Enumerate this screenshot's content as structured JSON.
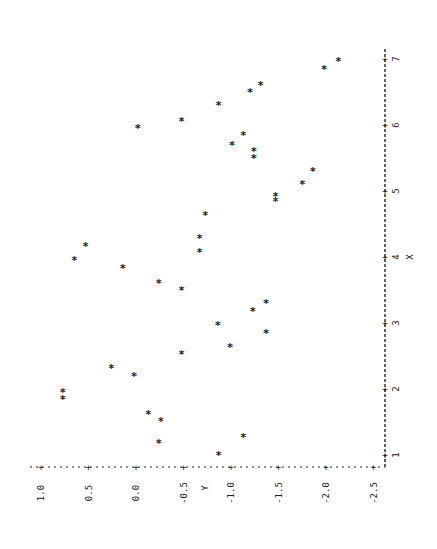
{
  "chart_data": {
    "type": "scatter",
    "title": "",
    "rotation": "rotated 90 degrees counter-clockwise (Y axis along bottom, X axis along right)",
    "xlabel": "X",
    "ylabel": "Y",
    "xlim": [
      1,
      7
    ],
    "ylim": [
      -2.5,
      1.0
    ],
    "x_ticks": [
      "1",
      "2",
      "3",
      "4",
      "5",
      "6",
      "7"
    ],
    "y_ticks": [
      "1.0",
      "0.5",
      "0.0",
      "-0.5",
      "-1.0",
      "-1.5",
      "-2.0",
      "-2.5"
    ],
    "marker": "*",
    "grid": false,
    "points": [
      {
        "x": 1.0,
        "y": -0.87
      },
      {
        "x": 1.18,
        "y": -0.24
      },
      {
        "x": 1.27,
        "y": -1.13
      },
      {
        "x": 1.52,
        "y": -0.26
      },
      {
        "x": 1.62,
        "y": -0.13
      },
      {
        "x": 1.85,
        "y": 0.77
      },
      {
        "x": 1.95,
        "y": 0.77
      },
      {
        "x": 2.2,
        "y": 0.02
      },
      {
        "x": 2.32,
        "y": 0.26
      },
      {
        "x": 2.53,
        "y": -0.48
      },
      {
        "x": 2.64,
        "y": -0.99
      },
      {
        "x": 2.85,
        "y": -1.37
      },
      {
        "x": 2.97,
        "y": -0.86
      },
      {
        "x": 3.18,
        "y": -1.23
      },
      {
        "x": 3.3,
        "y": -1.37
      },
      {
        "x": 3.5,
        "y": -0.48
      },
      {
        "x": 3.61,
        "y": -0.24
      },
      {
        "x": 3.83,
        "y": 0.14
      },
      {
        "x": 3.95,
        "y": 0.65
      },
      {
        "x": 4.07,
        "y": -0.67
      },
      {
        "x": 4.17,
        "y": 0.53
      },
      {
        "x": 4.29,
        "y": -0.67
      },
      {
        "x": 4.64,
        "y": -0.73
      },
      {
        "x": 4.85,
        "y": -1.47
      },
      {
        "x": 4.93,
        "y": -1.47
      },
      {
        "x": 5.1,
        "y": -1.75
      },
      {
        "x": 5.3,
        "y": -1.86
      },
      {
        "x": 5.5,
        "y": -1.24
      },
      {
        "x": 5.6,
        "y": -1.24
      },
      {
        "x": 5.7,
        "y": -1.01
      },
      {
        "x": 5.85,
        "y": -1.13
      },
      {
        "x": 5.95,
        "y": -0.02
      },
      {
        "x": 6.06,
        "y": -0.48
      },
      {
        "x": 6.3,
        "y": -0.87
      },
      {
        "x": 6.5,
        "y": -1.2
      },
      {
        "x": 6.6,
        "y": -1.31
      },
      {
        "x": 6.85,
        "y": -1.98
      },
      {
        "x": 6.97,
        "y": -2.13
      }
    ]
  }
}
